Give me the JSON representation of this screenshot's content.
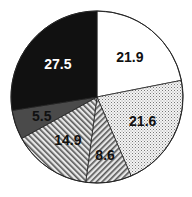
{
  "chart_data": {
    "type": "pie",
    "title": "",
    "start_angle_deg": 90,
    "direction": "clockwise",
    "slices": [
      {
        "label": "21.9",
        "value": 21.9,
        "fill": "white",
        "label_color": "#111111"
      },
      {
        "label": "21.6",
        "value": 21.6,
        "fill": "dots",
        "label_color": "#111111"
      },
      {
        "label": "8.6",
        "value": 8.6,
        "fill": "diag-right",
        "label_color": "#111111"
      },
      {
        "label": "14.9",
        "value": 14.9,
        "fill": "diag-left",
        "label_color": "#111111"
      },
      {
        "label": "5.5",
        "value": 5.5,
        "fill": "dark-gray",
        "label_color": "#111111"
      },
      {
        "label": "27.5",
        "value": 27.5,
        "fill": "black",
        "label_color": "#ffffff"
      }
    ],
    "categories": [
      "21.9",
      "21.6",
      "8.6",
      "14.9",
      "5.5",
      "27.5"
    ],
    "values": [
      21.9,
      21.6,
      8.6,
      14.9,
      5.5,
      27.5
    ],
    "legend": "none"
  }
}
